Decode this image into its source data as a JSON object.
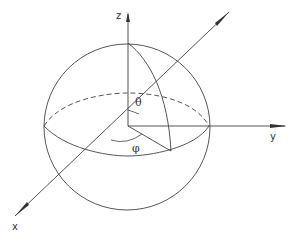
{
  "diagram": {
    "axes": {
      "z": "z",
      "y": "y",
      "x": "x"
    },
    "angles": {
      "theta": "θ",
      "phi": "φ"
    },
    "colors": {
      "line": "#333333",
      "background": "#ffffff"
    }
  }
}
